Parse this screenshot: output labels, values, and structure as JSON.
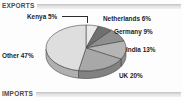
{
  "sections": {
    "top_label": "EXPORTS",
    "bottom_label": "IMPORTS"
  },
  "chart_data": {
    "type": "pie",
    "title": "EXPORTS",
    "xlabel": "",
    "ylabel": "",
    "legend_position": "none",
    "grid": false,
    "three_d": true,
    "categories": [
      "Kenya",
      "Netherlands",
      "Germany",
      "India",
      "UK",
      "Other"
    ],
    "values": [
      5,
      6,
      9,
      13,
      20,
      47
    ],
    "unit": "%",
    "slices": [
      {
        "label": "Kenya",
        "value": 5,
        "data_label": "Kenya 5%",
        "color": "#e9e9e9",
        "side_color": "#bdbdbd"
      },
      {
        "label": "Netherlands",
        "value": 6,
        "data_label": "Netherlands 6%",
        "color": "#6f6f6f",
        "side_color": "#545454"
      },
      {
        "label": "Germany",
        "value": 9,
        "data_label": "Germany 9%",
        "color": "#8f8f8f",
        "side_color": "#6d6d6d"
      },
      {
        "label": "India",
        "value": 13,
        "data_label": "India 13%",
        "color": "#b5b5b5",
        "side_color": "#8d8d8d"
      },
      {
        "label": "UK",
        "value": 20,
        "data_label": "UK 20%",
        "color": "#a8a8a8",
        "side_color": "#828282"
      },
      {
        "label": "Other",
        "value": 47,
        "data_label": "Other 47%",
        "color": "#dedede",
        "side_color": "#b0b0b0"
      }
    ],
    "colors": {
      "outline": "#3a3a3a",
      "text": "#1d1d1d",
      "background": "#fdfdfd",
      "rule": "#d2d2d2"
    }
  }
}
